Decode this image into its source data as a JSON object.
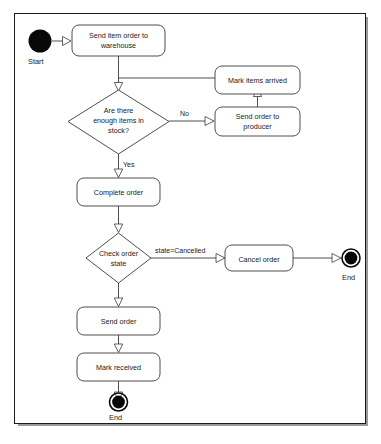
{
  "diagram": {
    "type": "uml-activity-diagram",
    "nodes": [
      {
        "id": "start",
        "kind": "initial",
        "label": "Start",
        "cx": 27,
        "cy": 27
      },
      {
        "id": "send-item-order",
        "kind": "action",
        "label": "Send item order to warehouse",
        "line1": "Send item order to",
        "line2": "warehouse",
        "x": 57,
        "y": 11,
        "w": 93,
        "h": 31
      },
      {
        "id": "mark-items-arrived",
        "kind": "action",
        "label": "Mark items arrived",
        "line1": "Mark items arrived",
        "line2": "",
        "x": 201,
        "y": 52,
        "w": 83,
        "h": 24
      },
      {
        "id": "stock-decision",
        "kind": "decision",
        "label": "Are there enough items in stock?",
        "line1": "Are there",
        "line2": "enough items in",
        "line3": "stock?",
        "cx": 110,
        "cy": 108,
        "hw": 44,
        "hh": 32
      },
      {
        "id": "send-order-producer",
        "kind": "action",
        "label": "Send order to producer",
        "line1": "Send order to",
        "line2": "producer",
        "x": 201,
        "y": 93,
        "w": 83,
        "h": 27
      },
      {
        "id": "complete-order",
        "kind": "action",
        "label": "Complete order",
        "line1": "Complete order",
        "line2": "",
        "x": 64,
        "y": 165,
        "w": 82,
        "h": 27
      },
      {
        "id": "check-order-state",
        "kind": "decision",
        "label": "Check order state",
        "line1": "Check order",
        "line2": "state",
        "line3": "",
        "cx": 110,
        "cy": 244,
        "hw": 35,
        "hh": 25
      },
      {
        "id": "cancel-order",
        "kind": "action",
        "label": "Cancel order",
        "line1": "Cancel order",
        "line2": "",
        "x": 212,
        "y": 232,
        "w": 79,
        "h": 25
      },
      {
        "id": "end-cancelled",
        "kind": "final",
        "label": "End",
        "cx": 353,
        "cy": 244
      },
      {
        "id": "send-order",
        "kind": "action",
        "label": "Send order",
        "line1": "Send order",
        "line2": "",
        "x": 72,
        "y": 294,
        "w": 80,
        "h": 27
      },
      {
        "id": "mark-received",
        "kind": "action",
        "label": "Mark received",
        "line1": "Mark received",
        "line2": "",
        "x": 72,
        "y": 340,
        "w": 80,
        "h": 27
      },
      {
        "id": "end-completed",
        "kind": "final",
        "label": "End",
        "cx": 110,
        "cy": 404
      }
    ],
    "edges": [
      {
        "id": "e-start-send",
        "from": "start",
        "to": "send-item-order",
        "label": ""
      },
      {
        "id": "e-send-markarrived",
        "from": "send-item-order",
        "to": "mark-items-arrived",
        "label": ""
      },
      {
        "id": "e-send-stockdecision",
        "from": "send-item-order",
        "to": "stock-decision",
        "label": ""
      },
      {
        "id": "e-stock-no",
        "from": "stock-decision",
        "to": "send-order-producer",
        "label": "No"
      },
      {
        "id": "e-stock-yes",
        "from": "stock-decision",
        "to": "complete-order",
        "label": "Yes"
      },
      {
        "id": "e-producer-markarrived",
        "from": "send-order-producer",
        "to": "mark-items-arrived",
        "label": ""
      },
      {
        "id": "e-complete-checkstate",
        "from": "complete-order",
        "to": "check-order-state",
        "label": ""
      },
      {
        "id": "e-checkstate-cancel",
        "from": "check-order-state",
        "to": "cancel-order",
        "label": "state=Cancelled"
      },
      {
        "id": "e-cancel-end",
        "from": "cancel-order",
        "to": "end-cancelled",
        "label": ""
      },
      {
        "id": "e-checkstate-sendorder",
        "from": "check-order-state",
        "to": "send-order",
        "label": ""
      },
      {
        "id": "e-sendorder-markreceived",
        "from": "send-order",
        "to": "mark-received",
        "label": ""
      },
      {
        "id": "e-markreceived-end",
        "from": "mark-received",
        "to": "end-completed",
        "label": ""
      }
    ],
    "labels": {
      "start": "Start",
      "end_cancelled": "End",
      "end_completed": "End",
      "send_item_order_l1": "Send item order to",
      "send_item_order_l2": "warehouse",
      "mark_items_arrived": "Mark items arrived",
      "stock_decision_l1": "Are there",
      "stock_decision_l2": "enough items in",
      "stock_decision_l3": "stock?",
      "send_order_producer_l1": "Send order to",
      "send_order_producer_l2": "producer",
      "complete_order": "Complete order",
      "check_order_state_l1": "Check order",
      "check_order_state_l2": "state",
      "cancel_order": "Cancel order",
      "send_order": "Send order",
      "mark_received": "Mark received",
      "edge_no": "No",
      "edge_yes": "Yes",
      "edge_state_cancelled": "state=Cancelled"
    },
    "colors": {
      "frame_border": "#1a1a1a",
      "shape_stroke": "#3b3b3b",
      "shape_fill": "#ffffff",
      "terminal_fill": "#080808",
      "text": "#1a1a1a",
      "background": "#ffffff"
    }
  }
}
